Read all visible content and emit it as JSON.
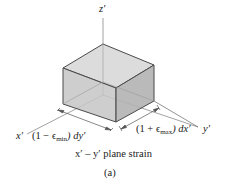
{
  "figure": {
    "axes": {
      "z_label": "z′",
      "x_label": "x′",
      "y_label": "y′"
    },
    "dimensions": {
      "left_prefix": "(1 − ϵ",
      "left_sub": "min",
      "left_suffix": ") dy′",
      "right_prefix": "(1 + ϵ",
      "right_sub": "max",
      "right_suffix": ") dx′"
    },
    "caption": "x′ – y′ plane strain",
    "panel_label": "(a)",
    "colors": {
      "top_face": "#d9d9d9",
      "left_face": "#c4c4c4",
      "right_face": "#b3b3b3",
      "edge": "#555555",
      "axis": "#777777"
    }
  }
}
